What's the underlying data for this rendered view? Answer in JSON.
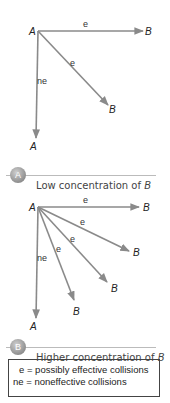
{
  "panels": [
    {
      "id": "low",
      "badge": "A",
      "caption_prefix": "Low concentration of ",
      "caption_var": "B",
      "origin_label": "A",
      "arrows": [
        {
          "to_label": "B",
          "edge_label": "e",
          "kind": "effective"
        },
        {
          "to_label": "B",
          "edge_label": "e",
          "kind": "effective"
        },
        {
          "to_label": "A",
          "edge_label": "ne",
          "kind": "noneffective"
        }
      ]
    },
    {
      "id": "high",
      "badge": "B",
      "caption_prefix": "Higher concentration of ",
      "caption_var": "B",
      "origin_label": "A",
      "arrows": [
        {
          "to_label": "B",
          "edge_label": "e",
          "kind": "effective"
        },
        {
          "to_label": "B",
          "edge_label": "e",
          "kind": "effective"
        },
        {
          "to_label": "B",
          "edge_label": "e",
          "kind": "effective"
        },
        {
          "to_label": "B",
          "edge_label": "e",
          "kind": "effective"
        },
        {
          "to_label": "A",
          "edge_label": "ne",
          "kind": "noneffective"
        }
      ]
    }
  ],
  "legend": {
    "line1": "e = possibly effective collisions",
    "line2": "ne = noneffective collisions"
  },
  "colors": {
    "arrow": "#8a8a8a",
    "badge": "#9a9a9a",
    "divider": "#bbbbbb"
  }
}
